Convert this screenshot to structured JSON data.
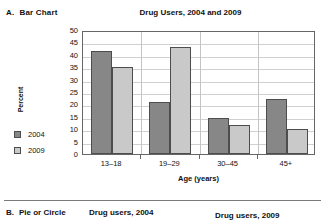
{
  "sections": {
    "a": {
      "letter": "A.",
      "label": "Bar Chart"
    },
    "b": {
      "letter": "B.",
      "label": "Pie or Circle",
      "pie_2004_title": "Drug users, 2004",
      "pie_2009_title": "Drug users, 2009"
    }
  },
  "legend": {
    "items": [
      {
        "label": "2004",
        "color": "#878787"
      },
      {
        "label": "2009",
        "color": "#c9c9c9"
      }
    ]
  },
  "chart_data": {
    "type": "bar",
    "title": "Drug Users, 2004 and 2009",
    "xlabel": "Age (years)",
    "ylabel": "Percent",
    "categories": [
      "13–18",
      "19–29",
      "30–45",
      "45+"
    ],
    "series": [
      {
        "name": "2004",
        "color": "#878787",
        "values": [
          41.5,
          21,
          14.7,
          22
        ]
      },
      {
        "name": "2009",
        "color": "#c9c9c9",
        "values": [
          35,
          43,
          11.6,
          10
        ]
      }
    ],
    "ylim": [
      0,
      50
    ],
    "yticks": [
      50,
      45,
      40,
      35,
      30,
      25,
      20,
      15,
      10,
      5,
      0
    ],
    "grid": true,
    "legend_position": "left"
  }
}
